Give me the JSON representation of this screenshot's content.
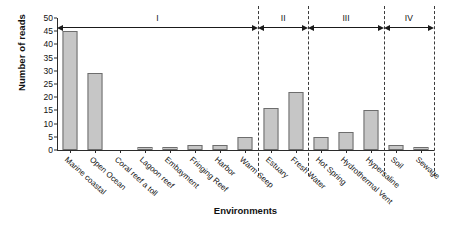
{
  "chart_data": {
    "type": "bar",
    "title": "",
    "xlabel": "Environments",
    "ylabel": "Number of reads",
    "ylim": [
      0,
      50
    ],
    "yticks": [
      0,
      5,
      10,
      15,
      20,
      25,
      30,
      35,
      40,
      45,
      50
    ],
    "grid": false,
    "legend": "none",
    "bar_color": "#c6c6c6",
    "bar_edge_color": "#6d6d6d",
    "categories": [
      "Marine coastal",
      "Open Ocean",
      "Coral reef a toll",
      "Lagoon reef",
      "Embayment",
      "Fringing Reef",
      "Harbor",
      "Warm Seep",
      "Estuary",
      "Fresh Water",
      "Hot Spring",
      "Hydrothermal Vent",
      "Hypersaline",
      "Soil",
      "Sewage"
    ],
    "values": [
      45,
      29,
      0,
      1,
      1,
      2,
      2,
      5,
      16,
      22,
      5,
      7,
      15,
      2,
      1
    ],
    "groups": [
      {
        "name": "I",
        "start": 0,
        "end": 7,
        "members": [
          "Marine coastal",
          "Open Ocean",
          "Coral reef a toll",
          "Lagoon reef",
          "Embayment",
          "Fringing Reef",
          "Harbor",
          "Warm Seep"
        ]
      },
      {
        "name": "II",
        "start": 8,
        "end": 9,
        "members": [
          "Estuary",
          "Fresh Water"
        ]
      },
      {
        "name": "III",
        "start": 10,
        "end": 12,
        "members": [
          "Hot Spring",
          "Hydrothermal Vent",
          "Hypersaline"
        ]
      },
      {
        "name": "IV",
        "start": 13,
        "end": 14,
        "members": [
          "Soil",
          "Sewage"
        ]
      }
    ]
  }
}
